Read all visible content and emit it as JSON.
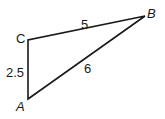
{
  "diagram": {
    "type": "triangle",
    "vertices": {
      "A": {
        "label": "A",
        "x": 28,
        "y": 99
      },
      "B": {
        "label": "B",
        "x": 145,
        "y": 16
      },
      "C": {
        "label": "C",
        "x": 28,
        "y": 40
      }
    },
    "sides": {
      "CB": {
        "label": "5"
      },
      "AB": {
        "label": "6"
      },
      "AC": {
        "label": "2.5"
      }
    },
    "stroke_color": "#1a1a1a"
  }
}
